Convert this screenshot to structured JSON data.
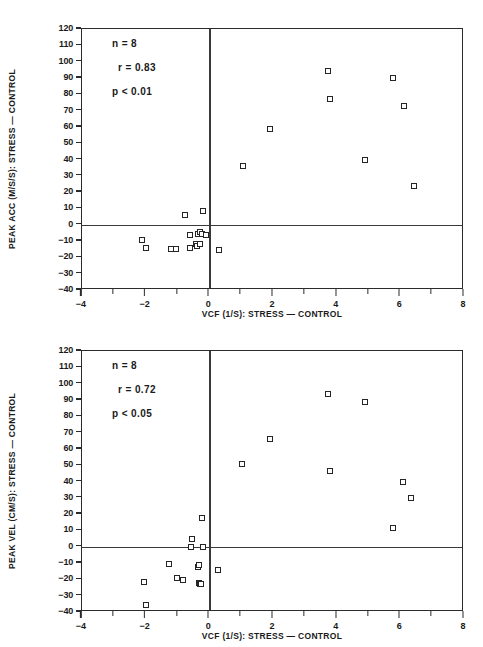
{
  "figure": {
    "marker_symbol": "open-square",
    "axis_color": "#2b2b2b"
  },
  "chart_data": [
    {
      "type": "scatter",
      "panel": "top",
      "title": "",
      "xlabel": "VCF (1/S): STRESS — CONTROL",
      "ylabel": "PEAK ACC (M/S/S): STRESS — CONTROL",
      "xlim": [
        -4,
        8
      ],
      "ylim": [
        -40,
        120
      ],
      "xticks": [
        -4,
        -3,
        -2,
        -1,
        0,
        1,
        2,
        3,
        4,
        5,
        6,
        7,
        8
      ],
      "xtick_labels": [
        "-4",
        "",
        "-2",
        "",
        "0",
        "",
        "2",
        "",
        "4",
        "",
        "6",
        "",
        "8"
      ],
      "yticks": [
        120,
        110,
        100,
        90,
        80,
        70,
        60,
        50,
        40,
        30,
        20,
        10,
        0,
        -10,
        -20,
        -30,
        -40
      ],
      "ytick_labels": [
        "120",
        "110",
        "100",
        "90",
        "80",
        "70",
        "60",
        "50",
        "40",
        "30",
        "20",
        "10",
        "0",
        "-10",
        "-20",
        "-30",
        "-40"
      ],
      "grid": false,
      "reference_lines": {
        "vertical_x": 0,
        "horizontal_y": 0
      },
      "legend": "none",
      "annotations": [
        {
          "text": "n = 8"
        },
        {
          "text": "r = 0.83"
        },
        {
          "text": "p < 0.01"
        }
      ],
      "points": [
        {
          "x": -2.1,
          "y": -9.5
        },
        {
          "x": -2.0,
          "y": -14.0
        },
        {
          "x": -1.2,
          "y": -15.0
        },
        {
          "x": -1.05,
          "y": -15.0
        },
        {
          "x": -0.78,
          "y": 6.0
        },
        {
          "x": -0.62,
          "y": -14.5
        },
        {
          "x": -0.6,
          "y": -6.0
        },
        {
          "x": -0.42,
          "y": -11.5
        },
        {
          "x": -0.38,
          "y": -13.0
        },
        {
          "x": -0.35,
          "y": -5.5
        },
        {
          "x": -0.3,
          "y": -4.5
        },
        {
          "x": -0.28,
          "y": -12.0
        },
        {
          "x": -0.22,
          "y": -5.5
        },
        {
          "x": -0.2,
          "y": 8.5
        },
        {
          "x": -0.12,
          "y": -6.0
        },
        {
          "x": 0.3,
          "y": -15.5
        },
        {
          "x": 1.05,
          "y": 36.0
        },
        {
          "x": 1.92,
          "y": 59.0
        },
        {
          "x": 3.72,
          "y": 94.5
        },
        {
          "x": 3.8,
          "y": 77.0
        },
        {
          "x": 4.9,
          "y": 39.5
        },
        {
          "x": 5.78,
          "y": 90.0
        },
        {
          "x": 6.1,
          "y": 72.5
        },
        {
          "x": 6.42,
          "y": 24.0
        }
      ]
    },
    {
      "type": "scatter",
      "panel": "bottom",
      "title": "",
      "xlabel": "VCF (1/S): STRESS — CONTROL",
      "ylabel": "PEAK VEL (CM/S): STRESS — CONTROL",
      "xlim": [
        -4,
        8
      ],
      "ylim": [
        -40,
        120
      ],
      "xticks": [
        -4,
        -3,
        -2,
        -1,
        0,
        1,
        2,
        3,
        4,
        5,
        6,
        7,
        8
      ],
      "xtick_labels": [
        "-4",
        "",
        "-2",
        "",
        "0",
        "",
        "2",
        "",
        "4",
        "",
        "6",
        "",
        "8"
      ],
      "yticks": [
        120,
        110,
        100,
        90,
        80,
        70,
        60,
        50,
        40,
        30,
        20,
        10,
        0,
        -10,
        -20,
        -30,
        -40
      ],
      "ytick_labels": [
        "120",
        "110",
        "100",
        "90",
        "80",
        "70",
        "60",
        "50",
        "40",
        "30",
        "20",
        "10",
        "0",
        "-10",
        "-20",
        "-30",
        "-40"
      ],
      "grid": false,
      "reference_lines": {
        "vertical_x": 0,
        "horizontal_y": 0
      },
      "legend": "none",
      "annotations": [
        {
          "text": "n = 8"
        },
        {
          "text": "r = 0.72"
        },
        {
          "text": "p < 0.05"
        }
      ],
      "points": [
        {
          "x": -2.05,
          "y": -21.5
        },
        {
          "x": -2.0,
          "y": -36.0
        },
        {
          "x": -1.28,
          "y": -10.5
        },
        {
          "x": -1.02,
          "y": -19.0
        },
        {
          "x": -0.82,
          "y": -20.5
        },
        {
          "x": -0.58,
          "y": 0.0
        },
        {
          "x": -0.55,
          "y": 4.5
        },
        {
          "x": -0.35,
          "y": -12.5
        },
        {
          "x": -0.34,
          "y": -11.0
        },
        {
          "x": -0.32,
          "y": -22.0
        },
        {
          "x": -0.28,
          "y": -23.0
        },
        {
          "x": -0.25,
          "y": -23.0
        },
        {
          "x": -0.22,
          "y": 17.5
        },
        {
          "x": -0.2,
          "y": 0.0
        },
        {
          "x": 0.28,
          "y": -14.5
        },
        {
          "x": 1.02,
          "y": 50.5
        },
        {
          "x": 1.9,
          "y": 66.0
        },
        {
          "x": 3.72,
          "y": 93.5
        },
        {
          "x": 3.78,
          "y": 46.5
        },
        {
          "x": 4.88,
          "y": 88.5
        },
        {
          "x": 5.78,
          "y": 11.5
        },
        {
          "x": 6.08,
          "y": 39.5
        },
        {
          "x": 6.35,
          "y": 30.0
        }
      ]
    }
  ]
}
